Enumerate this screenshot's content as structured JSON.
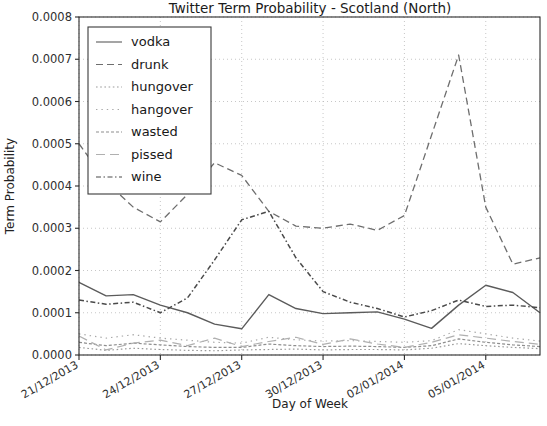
{
  "chart_data": {
    "type": "line",
    "title": "Twitter Term Probability - Scotland (North)",
    "xlabel": "Day of Week",
    "ylabel": "Term Probability",
    "grid": true,
    "legend_position": "upper left",
    "ylim": [
      0.0,
      0.0008
    ],
    "ytick_labels": [
      "0.0000",
      "0.0001",
      "0.0002",
      "0.0003",
      "0.0004",
      "0.0005",
      "0.0006",
      "0.0007",
      "0.0008"
    ],
    "ytick_values": [
      0.0,
      0.0001,
      0.0002,
      0.0003,
      0.0004,
      0.0005,
      0.0006,
      0.0007,
      0.0008
    ],
    "xtick_labels": [
      "21/12/2013",
      "24/12/2013",
      "27/12/2013",
      "30/12/2013",
      "02/01/2014",
      "05/01/2014"
    ],
    "xtick_indices": [
      0,
      3,
      6,
      9,
      12,
      15
    ],
    "x_index_count": 18,
    "series": [
      {
        "name": "vodka",
        "style": "solid",
        "color": "#5b5b5b",
        "width": 1.4,
        "values": [
          0.000172,
          0.00014,
          0.000143,
          0.000118,
          0.0001,
          7.3e-05,
          6.2e-05,
          0.000143,
          0.00011,
          9.8e-05,
          0.0001,
          0.000102,
          8.5e-05,
          6.3e-05,
          0.000118,
          0.000165,
          0.000148,
          0.0001
        ]
      },
      {
        "name": "drunk",
        "style": "dashed",
        "color": "#6e6e6e",
        "width": 1.3,
        "values": [
          0.0005,
          0.00041,
          0.00035,
          0.000315,
          0.00038,
          0.000455,
          0.000425,
          0.00034,
          0.000305,
          0.0003,
          0.00031,
          0.000295,
          0.00033,
          0.00052,
          0.00071,
          0.00035,
          0.000215,
          0.00023
        ]
      },
      {
        "name": "hungover",
        "style": "dotted",
        "color": "#9a9a9a",
        "width": 1.2,
        "values": [
          1.8e-05,
          1.1e-05,
          1.6e-05,
          1.3e-05,
          1.1e-05,
          1e-05,
          1.2e-05,
          1.3e-05,
          1.4e-05,
          1.2e-05,
          1.3e-05,
          1.3e-05,
          1.2e-05,
          1.6e-05,
          2.7e-05,
          2.2e-05,
          1.8e-05,
          1.5e-05
        ]
      },
      {
        "name": "hangover",
        "style": "loose-dotted",
        "color": "#a8a8a8",
        "width": 1.2,
        "values": [
          5e-05,
          4e-05,
          4.8e-05,
          4e-05,
          3.5e-05,
          3e-05,
          2.8e-05,
          4.2e-05,
          3.6e-05,
          3.3e-05,
          3.4e-05,
          3.2e-05,
          3e-05,
          3.4e-05,
          6e-05,
          5e-05,
          4e-05,
          3.3e-05
        ]
      },
      {
        "name": "wasted",
        "style": "dash-dense",
        "color": "#8e8e8e",
        "width": 1.2,
        "values": [
          3e-05,
          2.2e-05,
          2.8e-05,
          2.4e-05,
          2e-05,
          1.8e-05,
          1.8e-05,
          2.6e-05,
          2.2e-05,
          2e-05,
          2.1e-05,
          2e-05,
          1.8e-05,
          2.2e-05,
          3.8e-05,
          3e-05,
          2.4e-05,
          2e-05
        ]
      },
      {
        "name": "pissed",
        "style": "dash-long",
        "color": "#b0b0b0",
        "width": 1.2,
        "values": [
          4.5e-05,
          1.2e-05,
          2.8e-05,
          3.5e-05,
          2.2e-05,
          4e-05,
          2e-05,
          3.2e-05,
          4.2e-05,
          2.5e-05,
          3.8e-05,
          2.6e-05,
          1.8e-05,
          3e-05,
          4.8e-05,
          4e-05,
          3.2e-05,
          2.5e-05
        ]
      },
      {
        "name": "wine",
        "style": "dash-dot",
        "color": "#4a4a4a",
        "width": 1.5,
        "values": [
          0.00013,
          0.00012,
          0.000125,
          0.0001,
          0.000135,
          0.000225,
          0.00032,
          0.00034,
          0.00023,
          0.00015,
          0.000125,
          0.00011,
          9e-05,
          0.000105,
          0.00013,
          0.000115,
          0.000118,
          0.000112
        ]
      }
    ]
  }
}
